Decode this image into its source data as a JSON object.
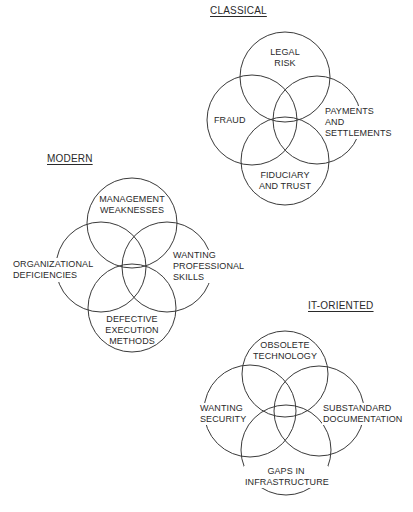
{
  "diagram": {
    "style": {
      "stroke_color": "#3a3a3a",
      "text_color": "#2a2a2a",
      "background": "#ffffff"
    },
    "clusters": [
      {
        "id": "classical",
        "title": "CLASSICAL",
        "circles": [
          {
            "name": "legal-risk",
            "lines": [
              "LEGAL",
              "RISK"
            ],
            "cx": 285,
            "cy": 77,
            "r": 45
          },
          {
            "name": "fraud",
            "lines": [
              "FRAUD"
            ],
            "cx": 252,
            "cy": 120,
            "r": 45
          },
          {
            "name": "payments-and-settlements",
            "lines": [
              "PAYMENTS",
              "AND",
              "SETTLEMENTS"
            ],
            "cx": 317,
            "cy": 120,
            "r": 44
          },
          {
            "name": "fiduciary-and-trust",
            "lines": [
              "FIDUCIARY",
              "AND TRUST"
            ],
            "cx": 285,
            "cy": 161,
            "r": 44
          }
        ]
      },
      {
        "id": "modern",
        "title": "MODERN",
        "circles": [
          {
            "name": "management-weaknesses",
            "lines": [
              "MANAGEMENT",
              "WEAKNESSES"
            ],
            "cx": 132,
            "cy": 223,
            "r": 45
          },
          {
            "name": "organizational-deficiencies",
            "lines": [
              "ORGANIZATIONAL",
              "DEFICIENCIES"
            ],
            "cx": 101,
            "cy": 267,
            "r": 45
          },
          {
            "name": "wanting-professional-skills",
            "lines": [
              "WANTING",
              "PROFESSIONAL",
              "SKILLS"
            ],
            "cx": 167,
            "cy": 267,
            "r": 45
          },
          {
            "name": "defective-execution-methods",
            "lines": [
              "DEFECTIVE",
              "EXECUTION",
              "METHODS"
            ],
            "cx": 132,
            "cy": 308,
            "r": 44
          }
        ]
      },
      {
        "id": "it-oriented",
        "title": "IT-ORIENTED",
        "circles": [
          {
            "name": "obsolete-technology",
            "lines": [
              "OBSOLETE",
              "TECHNOLOGY"
            ],
            "cx": 285,
            "cy": 374,
            "r": 43
          },
          {
            "name": "wanting-security",
            "lines": [
              "WANTING",
              "SECURITY"
            ],
            "cx": 250,
            "cy": 411,
            "r": 46
          },
          {
            "name": "substandard-documentation",
            "lines": [
              "SUBSTANDARD",
              "DOCUMENTATION"
            ],
            "cx": 319,
            "cy": 411,
            "r": 45
          },
          {
            "name": "gaps-in-infrastructure",
            "lines": [
              "GAPS IN",
              "INFRASTRUCTURE"
            ],
            "cx": 286,
            "cy": 450,
            "r": 45
          }
        ]
      }
    ]
  }
}
